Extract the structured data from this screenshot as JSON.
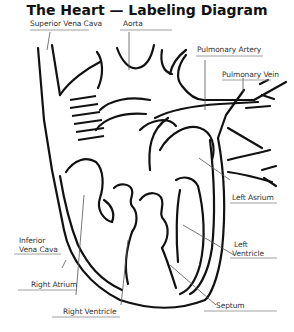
{
  "diagram": {
    "title": "The Heart — Labeling Diagram",
    "labels": {
      "superior_vena_cava": "Superior Vena Cava",
      "aorta": "Aorta",
      "pulmonary_artery": "Pulmonary Artery",
      "pulmonary_vein": "Pulmonary Vein",
      "left_atrium": "Left Asrium",
      "left_ventricle_1": "Left",
      "left_ventricle_2": "Ventricle",
      "inferior_vena_cava_1": "Inferior",
      "inferior_vena_cava_2": "Vena Cava",
      "right_atrium": "Right Atrium",
      "right_ventricle": "Right Ventricle",
      "septum": "Septum"
    },
    "colors": {
      "outline": "#111111",
      "leader_line": "#555555",
      "underline": "#888888",
      "background": "#ffffff"
    }
  }
}
